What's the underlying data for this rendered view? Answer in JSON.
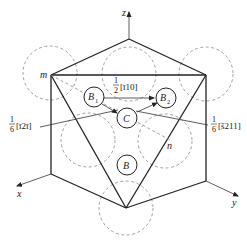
{
  "diagram": {
    "axes": {
      "x": "x",
      "y": "y",
      "z": "z"
    },
    "points": {
      "m": "m",
      "n": "n"
    },
    "atoms": {
      "B1": {
        "letter": "B",
        "sub": "1"
      },
      "B2": {
        "letter": "B",
        "sub": "2"
      },
      "C": {
        "letter": "C"
      },
      "B": {
        "letter": "B"
      }
    },
    "vectors": {
      "top": {
        "numerator": "1",
        "denominator": "2",
        "indices": "[ī10]"
      },
      "left": {
        "numerator": "1",
        "denominator": "6",
        "indices": "[ī2ī]"
      },
      "right": {
        "numerator": "1",
        "denominator": "6",
        "indices": "[š211]"
      }
    },
    "colors": {
      "line": "#222222",
      "dashed": "#888888",
      "background": "#ffffff"
    }
  }
}
